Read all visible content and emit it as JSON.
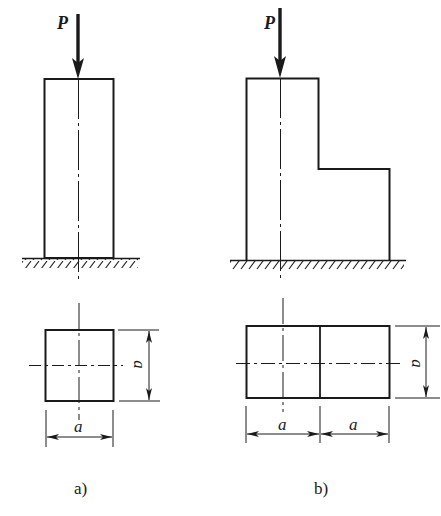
{
  "figure": {
    "panels": [
      {
        "id": "a",
        "caption": "a)",
        "force_label": "P",
        "elevation_shape": "rectangular column",
        "section": {
          "shape": "square",
          "width_label": "a",
          "height_label": "a"
        }
      },
      {
        "id": "b",
        "caption": "b)",
        "force_label": "P",
        "elevation_shape": "stepped column (L-shaped)",
        "section": {
          "shape": "rectangle (two squares)",
          "width_labels": [
            "a",
            "a"
          ],
          "height_label": "a"
        }
      }
    ],
    "colors": {
      "line": "#1a1a1a",
      "background": "#ffffff"
    }
  }
}
